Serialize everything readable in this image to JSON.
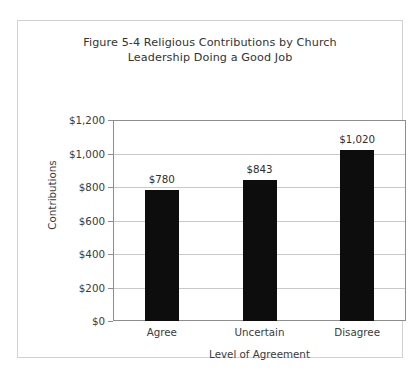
{
  "chart_data": {
    "type": "bar",
    "title": "Figure 5-4 Religious Contributions by Church Leadership Doing a Good Job",
    "title_lines": [
      "Figure 5-4 Religious Contributions by Church",
      "Leadership Doing a Good Job"
    ],
    "categories": [
      "Agree",
      "Uncertain",
      "Disagree"
    ],
    "values": [
      780,
      843,
      1020
    ],
    "value_labels": [
      "$780",
      "$843",
      "$1,020"
    ],
    "xlabel": "Level of Agreement",
    "ylabel": "Contributions",
    "ylim": [
      0,
      1200
    ],
    "ytick_values": [
      0,
      200,
      400,
      600,
      800,
      1000,
      1200
    ],
    "ytick_labels": [
      "$0",
      "$200",
      "$400",
      "$600",
      "$800",
      "$1,000",
      "$1,200"
    ],
    "grid": true,
    "legend": false,
    "bar_color": "#0d0d0d",
    "gridline_color": "#c9c9c9",
    "axis_color": "#8d8d8d",
    "frame_color": "#d2d2d2",
    "background_color": "#ffffff"
  }
}
